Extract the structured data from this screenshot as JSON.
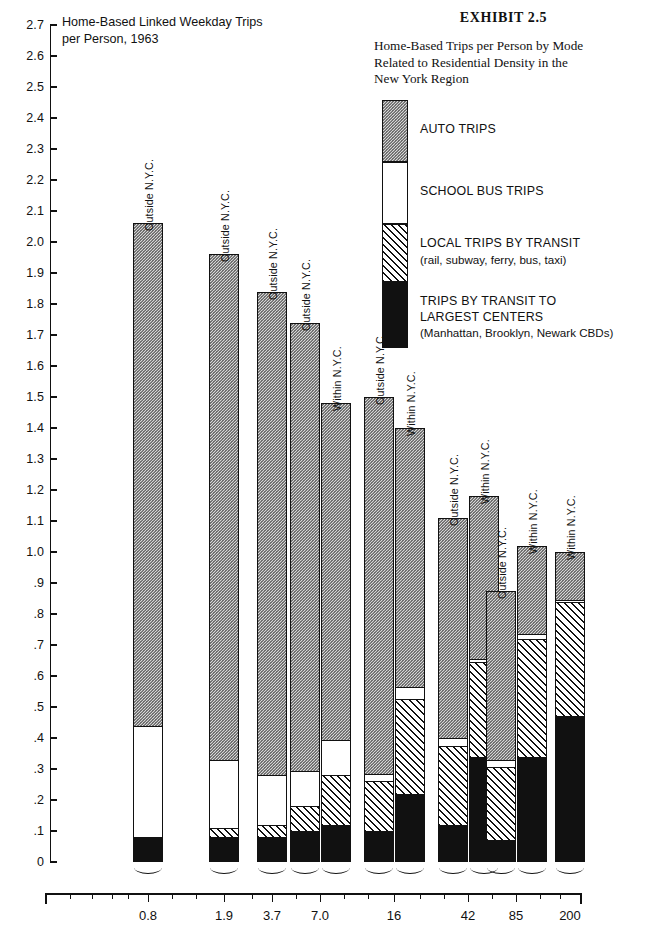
{
  "chart_title": "Home-Based Linked Weekday Trips\nper Person, 1963",
  "exhibit": {
    "number": "EXHIBIT  2.5",
    "subtitle": "Home-Based Trips per Person by Mode\nRelated to Residential Density in the\nNew York Region"
  },
  "legend": {
    "position": "top-right",
    "items": [
      {
        "key": "auto",
        "label": "AUTO TRIPS",
        "sub": "",
        "swatch": "dotted-gray"
      },
      {
        "key": "bus",
        "label": "SCHOOL BUS TRIPS",
        "sub": "",
        "swatch": "white"
      },
      {
        "key": "local",
        "label": "LOCAL TRIPS BY TRANSIT",
        "sub": "(rail, subway, ferry, bus, taxi)",
        "swatch": "hatched"
      },
      {
        "key": "center",
        "label": "TRIPS BY TRANSIT TO",
        "sub": "LARGEST CENTERS",
        "swatch": "black",
        "sub2": "(Manhattan, Brooklyn, Newark CBDs)"
      }
    ]
  },
  "chart_data": {
    "type": "bar",
    "subtype": "stacked-grouped",
    "xlabel": "Net Residential Density  Dwelling Units Per Acre",
    "ylabel": "",
    "ylim": [
      0,
      2.7
    ],
    "ytick_step": 0.1,
    "grid": false,
    "ytick_labels": [
      "2.7",
      "2.6",
      "2.5",
      "2.4",
      "2.3",
      "2.2",
      "2.1",
      "2.0",
      "1.9",
      "1.8",
      "1.7",
      "1.6",
      "1.5",
      "1.4",
      "1.3",
      "1.2",
      "1.1",
      "1.0",
      ".9",
      ".8",
      ".7",
      ".6",
      ".5",
      ".4",
      ".3",
      ".2",
      ".1",
      "0"
    ],
    "categories": [
      "0.8",
      "1.9",
      "3.7",
      "7.0",
      "16",
      "42",
      "85",
      "200"
    ],
    "xaxis_note": "logarithmic density scale",
    "series": [
      {
        "name": "TRIPS BY TRANSIT TO LARGEST CENTERS",
        "key": "center"
      },
      {
        "name": "LOCAL TRIPS BY TRANSIT",
        "key": "local"
      },
      {
        "name": "SCHOOL BUS TRIPS",
        "key": "bus"
      },
      {
        "name": "AUTO TRIPS",
        "key": "auto"
      }
    ],
    "bars": [
      {
        "category": "0.8",
        "group": "Outside N.Y.C.",
        "center": 0.08,
        "local": 0.0,
        "bus": 0.36,
        "auto": 1.62,
        "total": 2.06
      },
      {
        "category": "1.9",
        "group": "Outside N.Y.C.",
        "center": 0.08,
        "local": 0.03,
        "bus": 0.22,
        "auto": 1.63,
        "total": 1.96
      },
      {
        "category": "3.7",
        "group": "Outside N.Y.C.",
        "center": 0.08,
        "local": 0.04,
        "bus": 0.16,
        "auto": 1.56,
        "total": 1.84
      },
      {
        "category": "7.0",
        "group": "Outside N.Y.C.",
        "center": 0.1,
        "local": 0.08,
        "bus": 0.115,
        "auto": 1.445,
        "total": 1.74
      },
      {
        "category": "7.0",
        "group": "Within N.Y.C.",
        "center": 0.12,
        "local": 0.16,
        "bus": 0.115,
        "auto": 1.085,
        "total": 1.48
      },
      {
        "category": "16",
        "group": "Outside N.Y.C.",
        "center": 0.1,
        "local": 0.16,
        "bus": 0.025,
        "auto": 1.215,
        "total": 1.5
      },
      {
        "category": "16",
        "group": "Within N.Y.C.",
        "center": 0.22,
        "local": 0.305,
        "bus": 0.04,
        "auto": 0.835,
        "total": 1.4
      },
      {
        "category": "42",
        "group": "Outside N.Y.C.",
        "center": 0.12,
        "local": 0.255,
        "bus": 0.025,
        "auto": 0.71,
        "total": 1.11
      },
      {
        "category": "42",
        "group": "Within N.Y.C.",
        "center": 0.34,
        "local": 0.305,
        "bus": 0.01,
        "auto": 0.525,
        "total": 1.18
      },
      {
        "category": "85",
        "group": "Outside N.Y.C.",
        "center": 0.07,
        "local": 0.235,
        "bus": 0.025,
        "auto": 0.545,
        "total": 0.875
      },
      {
        "category": "85",
        "group": "Within N.Y.C.",
        "center": 0.34,
        "local": 0.38,
        "bus": 0.015,
        "auto": 0.285,
        "total": 1.02
      },
      {
        "category": "200",
        "group": "Within N.Y.C.",
        "center": 0.47,
        "local": 0.37,
        "bus": 0.005,
        "auto": 0.155,
        "total": 1.0
      }
    ]
  }
}
